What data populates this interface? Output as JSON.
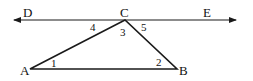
{
  "diagram": {
    "type": "geometry",
    "colors": {
      "stroke": "#1a1a1a",
      "background": "#ffffff"
    },
    "line_de": {
      "start": [
        14,
        20
      ],
      "end": [
        236,
        20
      ],
      "arrows": "both"
    },
    "vertices": {
      "A": {
        "label": "A",
        "x": 30,
        "y": 69
      },
      "B": {
        "label": "B",
        "x": 177,
        "y": 69
      },
      "C": {
        "label": "C",
        "x": 125,
        "y": 20
      }
    },
    "point_labels": {
      "D": "D",
      "E": "E",
      "A": "A",
      "B": "B",
      "C": "C"
    },
    "angle_labels": {
      "a1": "1",
      "a2": "2",
      "a3": "3",
      "a4": "4",
      "a5": "5"
    }
  }
}
